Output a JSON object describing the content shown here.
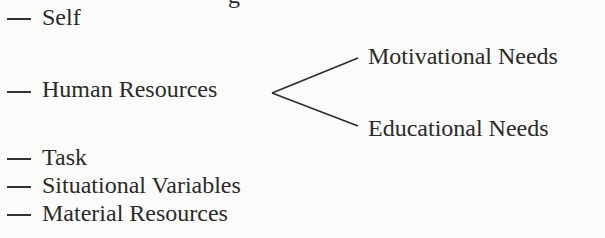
{
  "cropped_top_fragment": "g",
  "items": [
    {
      "label": "Self"
    },
    {
      "label": "Human Resources"
    },
    {
      "label": "Task"
    },
    {
      "label": "Situational Variables"
    },
    {
      "label": "Material Resources"
    }
  ],
  "branches": {
    "parent": "Human Resources",
    "children": [
      {
        "label": "Motivational Needs"
      },
      {
        "label": "Educational Needs"
      }
    ]
  },
  "colors": {
    "text": "#2a2a2a",
    "background": "#fbfbf9"
  }
}
